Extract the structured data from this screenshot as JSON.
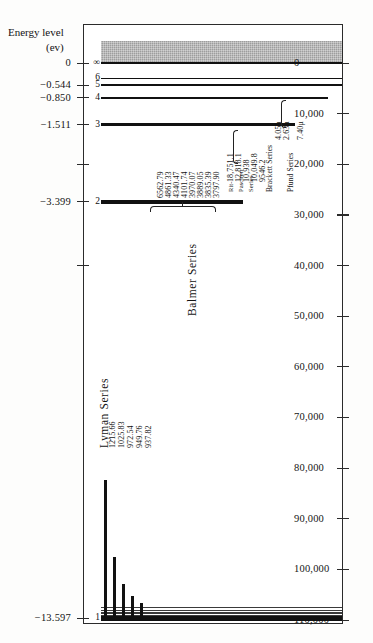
{
  "figure": {
    "left_axis_title_line1": "Energy level",
    "left_axis_title_line2": "(ev)",
    "right_axis_title_line1": "Wave number",
    "right_axis_title_line2": "(cm⁻¹)",
    "quantum_number_symbol": "n"
  },
  "chart_data": {
    "type": "diagram",
    "xlabel": "",
    "ylabel": "Energy level (ev)",
    "y2label": "Wave number (cm⁻¹)",
    "grid": false,
    "legend_position": "none",
    "left_axis": {
      "label": "Energy level (ev)",
      "unit": "ev",
      "ticks": [
        "0",
        "−0.544",
        "−0.850",
        "−1.511",
        "−3.399",
        "−13.597"
      ],
      "values": [
        0,
        -0.544,
        -0.85,
        -1.511,
        -3.399,
        -13.597
      ]
    },
    "right_axis": {
      "label": "Wave number (cm⁻¹)",
      "unit": "cm^-1",
      "ticks": [
        "0",
        "10,000",
        "20,000",
        "30,000",
        "40,000",
        "50,000",
        "60,000",
        "70,000",
        "80,000",
        "90,000",
        "100,000",
        "110,000"
      ],
      "values": [
        0,
        10000,
        20000,
        30000,
        40000,
        50000,
        60000,
        70000,
        80000,
        90000,
        100000,
        110000
      ]
    },
    "levels": [
      {
        "n": "∞",
        "energy_ev": 0.0,
        "wave_number": 0
      },
      {
        "n": "6",
        "energy_ev": -0.378,
        "wave_number": 3048
      },
      {
        "n": "5",
        "energy_ev": -0.544,
        "wave_number": 4389
      },
      {
        "n": "4",
        "energy_ev": -0.85,
        "wave_number": 6855
      },
      {
        "n": "3",
        "energy_ev": -1.511,
        "wave_number": 12186
      },
      {
        "n": "2",
        "energy_ev": -3.399,
        "wave_number": 27420
      },
      {
        "n": "1",
        "energy_ev": -13.597,
        "wave_number": 109678
      }
    ],
    "series": [
      {
        "name": "Lyman Series",
        "lower_level": 1,
        "unit": "Å",
        "lines": [
          "1215.66",
          "1025.83",
          "972.54",
          "949.76",
          "937.82"
        ]
      },
      {
        "name": "Balmer Series",
        "lower_level": 2,
        "unit": "Å",
        "lines": [
          "6562.79",
          "4861.33",
          "4340.47",
          "4101.74",
          "3970.07",
          "3889.05",
          "3835.39",
          "3797.90"
        ]
      },
      {
        "name": "Paschen Series",
        "lower_level": 3,
        "unit": "Å",
        "lines": [
          "18,751.1",
          "12,818.1",
          "10,938",
          "10,049.8",
          "9546.2"
        ]
      },
      {
        "name": "Brackett Series",
        "lower_level": 4,
        "unit": "μ",
        "lines": [
          "4.05μ",
          "2.63μ"
        ]
      },
      {
        "name": "Pfund Series",
        "lower_level": 5,
        "unit": "μ",
        "lines": [
          "7.40μ"
        ]
      }
    ]
  },
  "labels": {
    "lyman_title": "Lyman Series",
    "balmer_title": "Balmer Series",
    "paschen_title_1": "Rit-",
    "paschen_title_2": "Paschen",
    "paschen_title_3": "Series",
    "brackett_title": "Brackett Series",
    "pfund_title": "Pfund Series"
  }
}
